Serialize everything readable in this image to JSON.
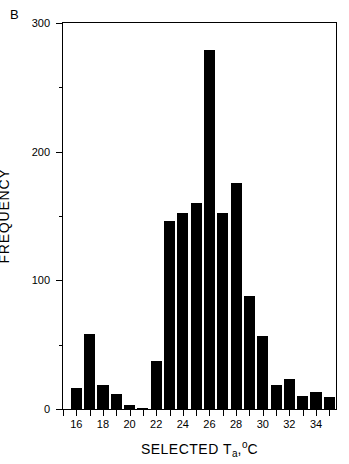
{
  "panel": {
    "label": "B"
  },
  "axes": {
    "y_title": "FREQUENCY",
    "x_title_parts": {
      "main": "SELECTED T",
      "sub": "a",
      "comma": ",",
      "degree": "o",
      "unit": "C"
    },
    "x_title_text": "SELECTED Ta,oC",
    "y_ticks": [
      "0",
      "100",
      "200",
      "300"
    ],
    "y_minor_ticks": [
      50,
      150,
      250
    ],
    "x_ticks": [
      "16",
      "18",
      "20",
      "22",
      "24",
      "26",
      "28",
      "30",
      "32",
      "34"
    ],
    "x_minor_ticks": [
      15,
      17,
      19,
      21,
      23,
      25,
      27,
      29,
      31,
      33,
      35
    ]
  },
  "colors": {
    "bar": "#000000",
    "axis": "#000000",
    "background": "#ffffff"
  },
  "chart_data": {
    "type": "bar",
    "title": "B",
    "xlabel": "SELECTED Ta, °C",
    "ylabel": "FREQUENCY",
    "xlim": [
      15.0,
      35.5
    ],
    "ylim": [
      0,
      300
    ],
    "grid": false,
    "legend": null,
    "bin_width": 1,
    "categories": [
      16,
      17,
      18,
      19,
      20,
      21,
      22,
      23,
      24,
      25,
      26,
      27,
      28,
      29,
      30,
      31,
      32,
      33,
      34,
      35
    ],
    "values": [
      16,
      58,
      19,
      12,
      3,
      1,
      37,
      146,
      152,
      160,
      279,
      152,
      176,
      88,
      57,
      19,
      23,
      10,
      13,
      9
    ],
    "tick_labels_x": [
      "16",
      "18",
      "20",
      "22",
      "24",
      "26",
      "28",
      "30",
      "32",
      "34"
    ],
    "tick_labels_y": [
      "0",
      "100",
      "200",
      "300"
    ]
  }
}
